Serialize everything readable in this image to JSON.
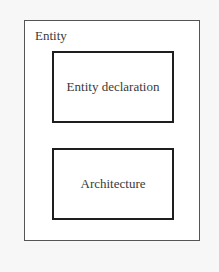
{
  "diagram": {
    "container": {
      "label": "Entity"
    },
    "blocks": [
      {
        "label": "Entity declaration"
      },
      {
        "label": "Architecture"
      }
    ]
  }
}
